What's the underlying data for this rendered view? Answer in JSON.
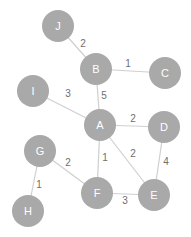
{
  "graph": {
    "node_radius": 16,
    "colors": {
      "node_fill": "#a9a9a9",
      "node_text": "#ffffff",
      "edge": "#cfcfcf",
      "edge_label": "#6e6e6e",
      "background": "#ffffff"
    },
    "nodes": [
      {
        "id": "J",
        "label": "J",
        "x": 58,
        "y": 26
      },
      {
        "id": "B",
        "label": "B",
        "x": 96,
        "y": 69
      },
      {
        "id": "C",
        "label": "C",
        "x": 165,
        "y": 73
      },
      {
        "id": "I",
        "label": "I",
        "x": 33,
        "y": 91
      },
      {
        "id": "A",
        "label": "A",
        "x": 100,
        "y": 125
      },
      {
        "id": "D",
        "label": "D",
        "x": 164,
        "y": 127
      },
      {
        "id": "G",
        "label": "G",
        "x": 40,
        "y": 151
      },
      {
        "id": "F",
        "label": "F",
        "x": 97,
        "y": 193
      },
      {
        "id": "E",
        "label": "E",
        "x": 154,
        "y": 195
      },
      {
        "id": "H",
        "label": "H",
        "x": 28,
        "y": 211
      }
    ],
    "edges": [
      {
        "from": "J",
        "to": "B",
        "weight": "2",
        "lx": 83,
        "ly": 43
      },
      {
        "from": "B",
        "to": "C",
        "weight": "1",
        "lx": 128,
        "ly": 63
      },
      {
        "from": "B",
        "to": "A",
        "weight": "5",
        "lx": 104,
        "ly": 95
      },
      {
        "from": "I",
        "to": "A",
        "weight": "3",
        "lx": 68,
        "ly": 93
      },
      {
        "from": "A",
        "to": "D",
        "weight": "2",
        "lx": 133,
        "ly": 118
      },
      {
        "from": "A",
        "to": "F",
        "weight": "1",
        "lx": 105,
        "ly": 157
      },
      {
        "from": "A",
        "to": "E",
        "weight": "2",
        "lx": 133,
        "ly": 153
      },
      {
        "from": "D",
        "to": "E",
        "weight": "4",
        "lx": 166,
        "ly": 161
      },
      {
        "from": "G",
        "to": "F",
        "weight": "2",
        "lx": 68,
        "ly": 162
      },
      {
        "from": "G",
        "to": "H",
        "weight": "1",
        "lx": 39,
        "ly": 184
      },
      {
        "from": "F",
        "to": "E",
        "weight": "3",
        "lx": 125,
        "ly": 200
      }
    ]
  }
}
